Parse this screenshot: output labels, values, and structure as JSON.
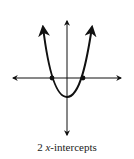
{
  "diagram": {
    "type": "parabola-graph",
    "x_intercept_count": 2,
    "caption": {
      "number": "2",
      "variable": "x",
      "suffix": "-intercepts"
    },
    "colors": {
      "line": "#111111",
      "background": "#ffffff"
    }
  }
}
